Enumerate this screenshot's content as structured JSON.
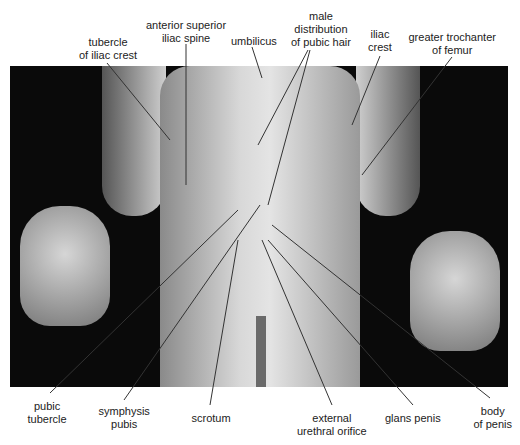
{
  "figure": {
    "type": "labeled anatomical photograph",
    "view": "anterior"
  },
  "labels": {
    "top": [
      {
        "lines": [
          "tubercle",
          "of iliac crest"
        ],
        "x": 108,
        "y": 36
      },
      {
        "lines": [
          "anterior superior",
          "iliac spine"
        ],
        "x": 186,
        "y": 19
      },
      {
        "lines": [
          "umbilicus"
        ],
        "x": 254,
        "y": 35
      },
      {
        "lines": [
          "male",
          "distribution",
          "of pubic hair"
        ],
        "x": 321,
        "y": 10
      },
      {
        "lines": [
          "iliac",
          "crest"
        ],
        "x": 380,
        "y": 28
      },
      {
        "lines": [
          "greater trochanter",
          "of femur"
        ],
        "x": 452,
        "y": 31
      }
    ],
    "bottom": [
      {
        "lines": [
          "pubic",
          "tubercle"
        ],
        "x": 47,
        "y": 400
      },
      {
        "lines": [
          "symphysis",
          "pubis"
        ],
        "x": 124,
        "y": 405
      },
      {
        "lines": [
          "scrotum"
        ],
        "x": 211,
        "y": 412
      },
      {
        "lines": [
          "external",
          "urethral orifice"
        ],
        "x": 332,
        "y": 412
      },
      {
        "lines": [
          "glans penis"
        ],
        "x": 413,
        "y": 412
      },
      {
        "lines": [
          "body",
          "of penis"
        ],
        "x": 493,
        "y": 405
      }
    ]
  },
  "leaders": [
    {
      "x1": 107,
      "y1": 63,
      "x2": 170,
      "y2": 140
    },
    {
      "x1": 186,
      "y1": 44,
      "x2": 186,
      "y2": 185
    },
    {
      "x1": 252,
      "y1": 47,
      "x2": 262,
      "y2": 78
    },
    {
      "x1": 308,
      "y1": 50,
      "x2": 258,
      "y2": 145
    },
    {
      "x1": 310,
      "y1": 50,
      "x2": 268,
      "y2": 205
    },
    {
      "x1": 380,
      "y1": 56,
      "x2": 352,
      "y2": 125
    },
    {
      "x1": 452,
      "y1": 57,
      "x2": 362,
      "y2": 175
    },
    {
      "x1": 50,
      "y1": 393,
      "x2": 238,
      "y2": 210
    },
    {
      "x1": 124,
      "y1": 400,
      "x2": 260,
      "y2": 205
    },
    {
      "x1": 210,
      "y1": 405,
      "x2": 238,
      "y2": 240
    },
    {
      "x1": 332,
      "y1": 405,
      "x2": 262,
      "y2": 240
    },
    {
      "x1": 413,
      "y1": 405,
      "x2": 268,
      "y2": 240
    },
    {
      "x1": 490,
      "y1": 398,
      "x2": 272,
      "y2": 225
    }
  ]
}
